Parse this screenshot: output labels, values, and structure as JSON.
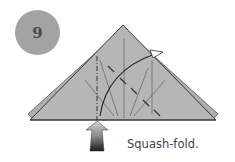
{
  "step": {
    "number": "9"
  },
  "caption": "Squash-fold.",
  "colors": {
    "badge": "#a3a3a3",
    "paper": "#b4b4b4",
    "line": "#333333",
    "arrow_top": "#c8c8c8",
    "arrow_bottom": "#2a2a2a"
  },
  "icons": [
    "step-number-badge",
    "push-arrow-icon",
    "fold-arrow-icon"
  ]
}
